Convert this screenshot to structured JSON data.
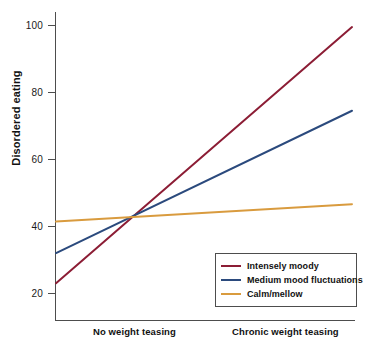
{
  "chart_data": {
    "type": "line",
    "title": "",
    "xlabel": "",
    "ylabel": "Disordered eating",
    "categories": [
      "No weight teasing",
      "Chronic weight teasing"
    ],
    "x": [
      0,
      1
    ],
    "ylim": [
      12,
      104
    ],
    "yticks": [
      20,
      40,
      60,
      80,
      100
    ],
    "ytick_labels": [
      "20",
      "40",
      "60",
      "80",
      "100"
    ],
    "grid": false,
    "legend_position": "bottom-right",
    "series": [
      {
        "name": "Intensely moody",
        "color": "#8c1d35",
        "values": [
          23.0,
          99.5
        ]
      },
      {
        "name": "Medium mood fluctuations",
        "color": "#2b4a7d",
        "values": [
          32.0,
          74.5
        ]
      },
      {
        "name": "Calm/mellow",
        "color": "#d99b3e",
        "values": [
          41.4,
          46.6
        ]
      }
    ]
  },
  "axes": {
    "y_title": "Disordered eating",
    "y_ticks": [
      {
        "value": 100,
        "label": "100"
      },
      {
        "value": 80,
        "label": "80"
      },
      {
        "value": 60,
        "label": "60"
      },
      {
        "value": 40,
        "label": "40"
      },
      {
        "value": 20,
        "label": "20"
      }
    ],
    "x_categories": [
      {
        "label": "No weight teasing"
      },
      {
        "label": "Chronic weight teasing"
      }
    ]
  },
  "legend": {
    "items": [
      {
        "label": "Intensely moody",
        "color": "#8c1d35"
      },
      {
        "label": "Medium mood fluctuations",
        "color": "#2b4a7d"
      },
      {
        "label": "Calm/mellow",
        "color": "#d99b3e"
      }
    ]
  }
}
